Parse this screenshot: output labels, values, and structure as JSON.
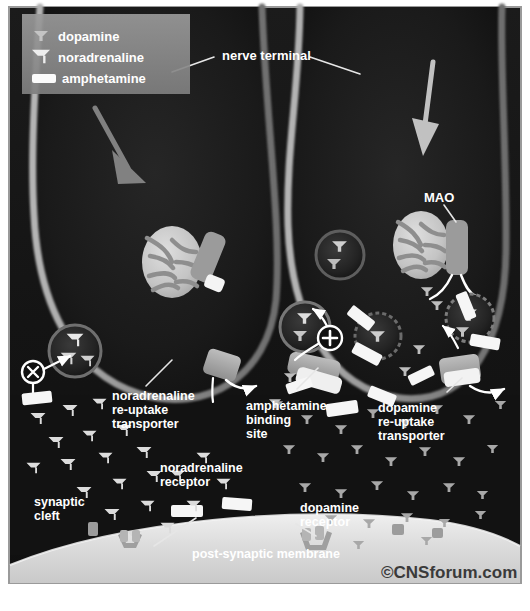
{
  "image": {
    "title": "Amphetamine action at noradrenaline and dopamine nerve terminals",
    "width": 530,
    "height": 611,
    "background": "#ffffff",
    "panel_border": "#9a9a9a"
  },
  "legend": {
    "name": "legend",
    "box_color": "#8c8c8c",
    "items": [
      {
        "label": "dopamine",
        "icon": "dopamine-glyph",
        "color": "#b9b9b9",
        "size": "small"
      },
      {
        "label": "noradrenaline",
        "icon": "noradrenaline-glyph",
        "color": "#d8d8d8",
        "size": "large"
      },
      {
        "label": "amphetamine",
        "icon": "amphetamine-bar",
        "color": "#ffffff",
        "size": "bar"
      }
    ]
  },
  "labels": {
    "nerve_terminal": "nerve terminal",
    "mao": "MAO",
    "noradrenaline_transporter": [
      "noradrenaline",
      "re-uptake",
      "transporter"
    ],
    "amphetamine_binding_site": [
      "amphetamine",
      "binding",
      "site"
    ],
    "dopamine_transporter": [
      "dopamine",
      "re-uptake",
      "transporter"
    ],
    "noradrenaline_receptor": [
      "noradrenaline",
      "receptor"
    ],
    "dopamine_receptor": [
      "dopamine",
      "receptor"
    ],
    "synaptic_cleft": [
      "synaptic",
      "cleft"
    ],
    "post_synaptic_membrane": "post-synaptic membrane",
    "watermark": "©CNSforum.com"
  },
  "markers": {
    "inhibition": "x",
    "stimulation": "+"
  },
  "colors": {
    "terminal_fill": "#171717",
    "terminal_membrane": "#8e8e8e",
    "cleft": "#141414",
    "post_membrane": "#d9d9d9",
    "mito_fill": "#c8c8c8",
    "mito_cristae": "#8a8a8a",
    "vesicle_ring": "#5a5a5a",
    "transporter": "#9e9e9e",
    "arrow_big": "#a0a0a0",
    "arrow_small": "#ffffff",
    "text": "#ffffff"
  },
  "structures": {
    "terminals": [
      {
        "name": "left-nerve-terminal",
        "type": "noradrenergic"
      },
      {
        "name": "right-nerve-terminal",
        "type": "dopaminergic"
      }
    ],
    "mitochondria": 2,
    "vesicles_left": 1,
    "vesicles_right": 4,
    "big_arrows": 2
  }
}
